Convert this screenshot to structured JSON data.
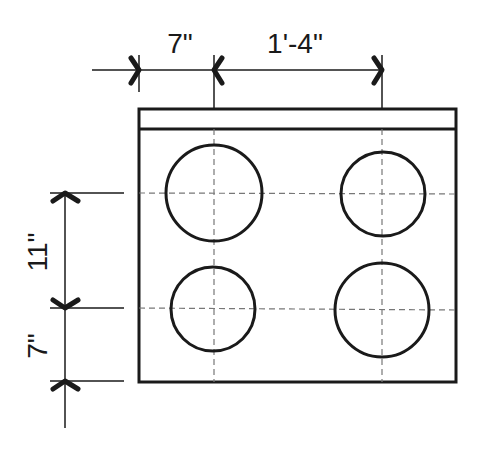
{
  "diagram": {
    "dimensions": {
      "top_left_offset": "7\"",
      "top_burner_spacing": "1'-4\"",
      "left_burner_spacing": "11\"",
      "left_bottom_offset": "7\""
    },
    "burners": [
      {
        "id": "top-left",
        "size": "large"
      },
      {
        "id": "top-right",
        "size": "small"
      },
      {
        "id": "bottom-left",
        "size": "small"
      },
      {
        "id": "bottom-right",
        "size": "large"
      }
    ],
    "colors": {
      "line": "#1a1a1a",
      "centerline": "#777777",
      "background": "#ffffff"
    }
  }
}
